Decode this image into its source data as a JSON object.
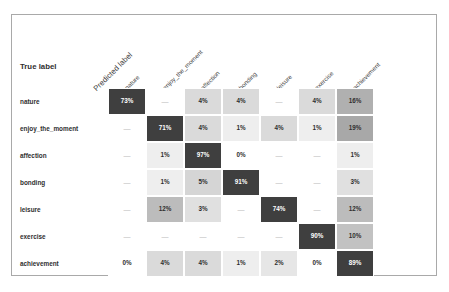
{
  "figure": {
    "axis_title_x": "Predicted label",
    "axis_title_y": "True label"
  },
  "chart_data": {
    "type": "heatmap",
    "subtype": "confusion-matrix",
    "title": "",
    "xlabel": "Predicted label",
    "ylabel": "True label",
    "grid": false,
    "legend": "none",
    "value_format": "percent",
    "null_display": "—",
    "colormap": {
      "low": "#ffffff",
      "high": "#3f3f3f",
      "scale_max": 100,
      "diagonal_color": "#3f3f3f",
      "diagonal_text_color": "#ffffff",
      "offdiagonal_text_color": "#2f2f2f"
    },
    "categories": [
      "nature",
      "enjoy_the_moment",
      "affection",
      "bonding",
      "leisure",
      "exercise",
      "achievement"
    ],
    "x_tick_labels": [
      "nature",
      "enjoy_the_moment",
      "affection",
      "bonding",
      "leisure",
      "exercise",
      "achievement"
    ],
    "y_tick_labels": [
      "nature",
      "enjoy_the_moment",
      "affection",
      "bonding",
      "leisure",
      "exercise",
      "achievement"
    ],
    "rows": [
      {
        "label": "nature",
        "cells": [
          {
            "text": "73%",
            "value": 73,
            "diagonal": true
          },
          {
            "text": "—",
            "value": null,
            "diagonal": false
          },
          {
            "text": "4%",
            "value": 4,
            "diagonal": false
          },
          {
            "text": "4%",
            "value": 4,
            "diagonal": false
          },
          {
            "text": "—",
            "value": null,
            "diagonal": false
          },
          {
            "text": "4%",
            "value": 4,
            "diagonal": false
          },
          {
            "text": "16%",
            "value": 16,
            "diagonal": false
          }
        ]
      },
      {
        "label": "enjoy_the_moment",
        "cells": [
          {
            "text": "—",
            "value": null,
            "diagonal": false
          },
          {
            "text": "71%",
            "value": 71,
            "diagonal": true
          },
          {
            "text": "4%",
            "value": 4,
            "diagonal": false
          },
          {
            "text": "1%",
            "value": 1,
            "diagonal": false
          },
          {
            "text": "4%",
            "value": 4,
            "diagonal": false
          },
          {
            "text": "1%",
            "value": 1,
            "diagonal": false
          },
          {
            "text": "19%",
            "value": 19,
            "diagonal": false
          }
        ]
      },
      {
        "label": "affection",
        "cells": [
          {
            "text": "—",
            "value": null,
            "diagonal": false
          },
          {
            "text": "1%",
            "value": 1,
            "diagonal": false
          },
          {
            "text": "97%",
            "value": 97,
            "diagonal": true
          },
          {
            "text": "0%",
            "value": 0,
            "diagonal": false
          },
          {
            "text": "—",
            "value": null,
            "diagonal": false
          },
          {
            "text": "—",
            "value": null,
            "diagonal": false
          },
          {
            "text": "1%",
            "value": 1,
            "diagonal": false
          }
        ]
      },
      {
        "label": "bonding",
        "cells": [
          {
            "text": "—",
            "value": null,
            "diagonal": false
          },
          {
            "text": "1%",
            "value": 1,
            "diagonal": false
          },
          {
            "text": "5%",
            "value": 5,
            "diagonal": false
          },
          {
            "text": "91%",
            "value": 91,
            "diagonal": true
          },
          {
            "text": "—",
            "value": null,
            "diagonal": false
          },
          {
            "text": "—",
            "value": null,
            "diagonal": false
          },
          {
            "text": "3%",
            "value": 3,
            "diagonal": false
          }
        ]
      },
      {
        "label": "leisure",
        "cells": [
          {
            "text": "—",
            "value": null,
            "diagonal": false
          },
          {
            "text": "12%",
            "value": 12,
            "diagonal": false
          },
          {
            "text": "3%",
            "value": 3,
            "diagonal": false
          },
          {
            "text": "—",
            "value": null,
            "diagonal": false
          },
          {
            "text": "74%",
            "value": 74,
            "diagonal": true
          },
          {
            "text": "—",
            "value": null,
            "diagonal": false
          },
          {
            "text": "12%",
            "value": 12,
            "diagonal": false
          }
        ]
      },
      {
        "label": "exercise",
        "cells": [
          {
            "text": "—",
            "value": null,
            "diagonal": false
          },
          {
            "text": "—",
            "value": null,
            "diagonal": false
          },
          {
            "text": "—",
            "value": null,
            "diagonal": false
          },
          {
            "text": "—",
            "value": null,
            "diagonal": false
          },
          {
            "text": "—",
            "value": null,
            "diagonal": false
          },
          {
            "text": "90%",
            "value": 90,
            "diagonal": true
          },
          {
            "text": "10%",
            "value": 10,
            "diagonal": false
          }
        ]
      },
      {
        "label": "achievement",
        "cells": [
          {
            "text": "0%",
            "value": 0,
            "diagonal": false
          },
          {
            "text": "4%",
            "value": 4,
            "diagonal": false
          },
          {
            "text": "4%",
            "value": 4,
            "diagonal": false
          },
          {
            "text": "1%",
            "value": 1,
            "diagonal": false
          },
          {
            "text": "2%",
            "value": 2,
            "diagonal": false
          },
          {
            "text": "0%",
            "value": 0,
            "diagonal": false
          },
          {
            "text": "89%",
            "value": 89,
            "diagonal": true
          }
        ]
      }
    ]
  }
}
